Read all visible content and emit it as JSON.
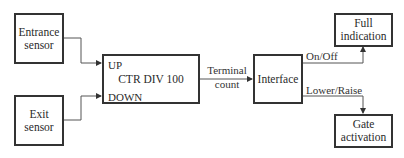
{
  "diagram": {
    "blocks": {
      "entrance_sensor": {
        "line1": "Entrance",
        "line2": "sensor"
      },
      "exit_sensor": {
        "line1": "Exit",
        "line2": "sensor"
      },
      "counter": {
        "title": "CTR DIV 100",
        "input_up": "UP",
        "input_down": "DOWN"
      },
      "interface": {
        "label": "Interface"
      },
      "full_indication": {
        "line1": "Full",
        "line2": "indication"
      },
      "gate_activation": {
        "line1": "Gate",
        "line2": "activation"
      }
    },
    "signals": {
      "terminal_count_line1": "Terminal",
      "terminal_count_line2": "count",
      "on_off": "On/Off",
      "lower_raise": "Lower/Raise"
    }
  }
}
